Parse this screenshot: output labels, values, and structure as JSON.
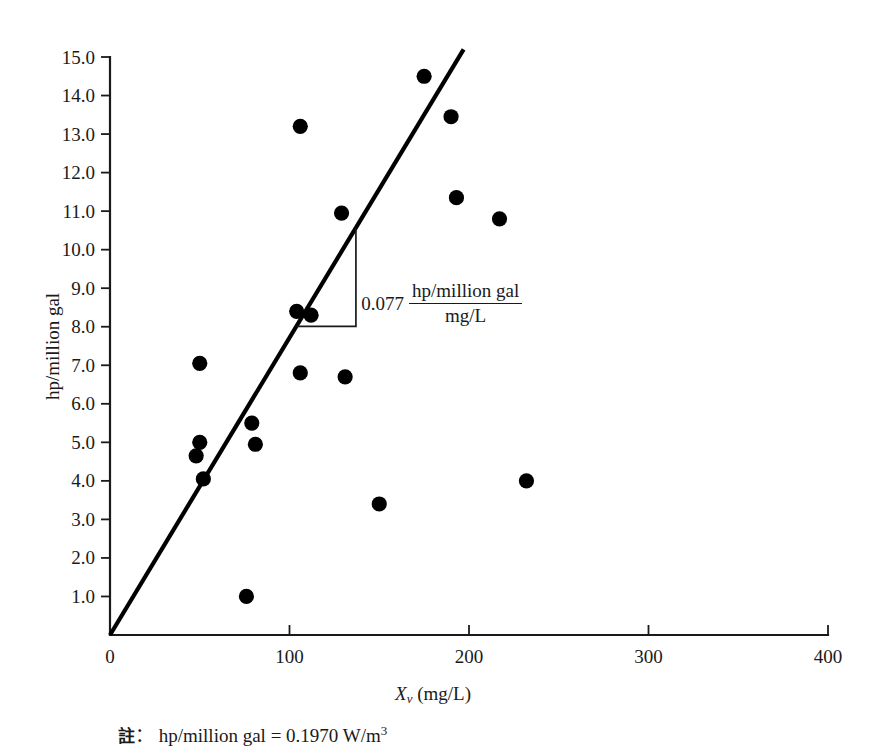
{
  "chart_data": {
    "type": "scatter",
    "title": "",
    "xlabel": "Xv (mg/L)",
    "ylabel": "hp/million gal",
    "xlim": [
      0,
      400
    ],
    "ylim": [
      0,
      15
    ],
    "grid": false,
    "legend": "none",
    "x_ticks": [
      "0",
      "100",
      "200",
      "300",
      "400"
    ],
    "x_tick_values": [
      0,
      100,
      200,
      300,
      400
    ],
    "y_ticks": [
      "1.0",
      "2.0",
      "3.0",
      "4.0",
      "5.0",
      "6.0",
      "7.0",
      "8.0",
      "9.0",
      "10.0",
      "11.0",
      "12.0",
      "13.0",
      "14.0",
      "15.0"
    ],
    "y_tick_values": [
      1,
      2,
      3,
      4,
      5,
      6,
      7,
      8,
      9,
      10,
      11,
      12,
      13,
      14,
      15
    ],
    "points": [
      {
        "x": 48,
        "y": 4.65
      },
      {
        "x": 50,
        "y": 5.0
      },
      {
        "x": 50,
        "y": 7.05
      },
      {
        "x": 52,
        "y": 4.05
      },
      {
        "x": 76,
        "y": 1.0
      },
      {
        "x": 79,
        "y": 5.5
      },
      {
        "x": 81,
        "y": 4.95
      },
      {
        "x": 104,
        "y": 8.4
      },
      {
        "x": 106,
        "y": 6.8
      },
      {
        "x": 106,
        "y": 13.2
      },
      {
        "x": 112,
        "y": 8.3
      },
      {
        "x": 129,
        "y": 10.95
      },
      {
        "x": 131,
        "y": 6.7
      },
      {
        "x": 150,
        "y": 3.4
      },
      {
        "x": 175,
        "y": 14.5
      },
      {
        "x": 190,
        "y": 13.45
      },
      {
        "x": 193,
        "y": 11.35
      },
      {
        "x": 217,
        "y": 10.8
      },
      {
        "x": 232,
        "y": 4.0
      }
    ],
    "trendline": {
      "slope": 0.077,
      "intercept": 0,
      "x_start": 0,
      "y_start": 0,
      "x_end": 197,
      "y_end": 15.2
    },
    "annotations": {
      "slope_value": "0.077",
      "slope_numerator": "hp/million gal",
      "slope_denominator": "mg/L"
    },
    "footnote": {
      "marker": "註",
      "separator": "：",
      "text": "hp/million gal = 0.1970 W/m",
      "exponent": "3"
    }
  }
}
